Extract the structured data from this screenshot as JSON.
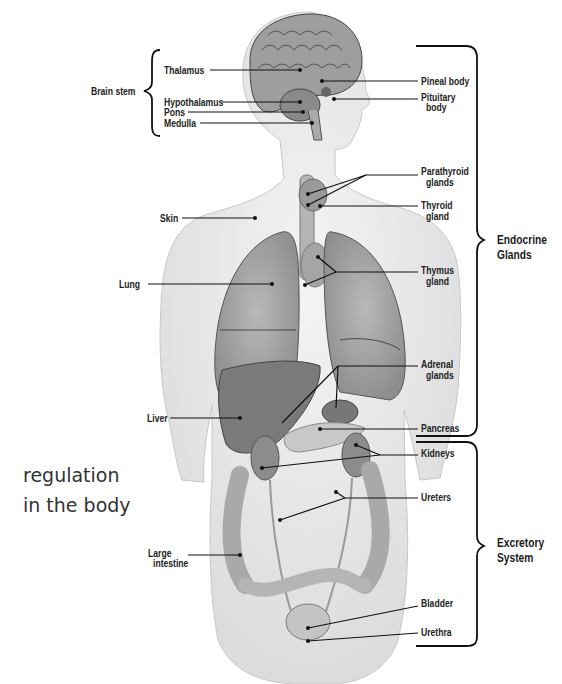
{
  "side_caption": {
    "line1": "regulation",
    "line2": "in the body"
  },
  "groups": {
    "brain_stem": "Brain stem",
    "endocrine": {
      "line1": "Endocrine",
      "line2": "Glands"
    },
    "excretory": {
      "line1": "Excretory",
      "line2": "System"
    }
  },
  "labels_left": {
    "thalamus": "Thalamus",
    "hypothalamus": "Hypothalamus",
    "pons": "Pons",
    "medulla": "Medulla",
    "skin": "Skin",
    "lung": "Lung",
    "liver": "Liver",
    "large_intestine": {
      "line1": "Large",
      "line2": "intestine"
    }
  },
  "labels_right": {
    "pineal": "Pineal body",
    "pituitary": {
      "line1": "Pituitary",
      "line2": "body"
    },
    "parathyroid": {
      "line1": "Parathyroid",
      "line2": "glands"
    },
    "thyroid": {
      "line1": "Thyroid",
      "line2": "gland"
    },
    "thymus": {
      "line1": "Thymus",
      "line2": "gland"
    },
    "adrenal": {
      "line1": "Adrenal",
      "line2": "glands"
    },
    "pancreas": "Pancreas",
    "kidneys": "Kidneys",
    "ureters": "Ureters",
    "bladder": "Bladder",
    "urethra": "Urethra"
  }
}
